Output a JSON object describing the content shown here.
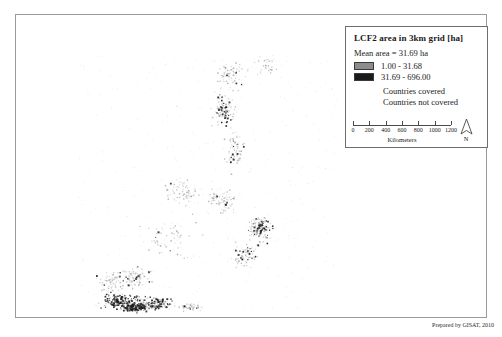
{
  "legend": {
    "title": "LCF2 area in 3km grid [ha]",
    "mean_area": "Mean area = 31.69 ha",
    "classes": [
      {
        "swatch_color": "#8c8c8c",
        "label": "1.00  -   31.68"
      },
      {
        "swatch_color": "#1a1a1a",
        "label": "31.69  -  696.00"
      }
    ],
    "countries_covered": "Countries covered",
    "countries_not_covered": "Countries not covered",
    "scalebar": {
      "ticks": [
        "0",
        "200",
        "400",
        "600",
        "800",
        "1000",
        "1200"
      ],
      "unit": "Kilometers"
    },
    "north_label": "N"
  },
  "credit": "Prepared by GISAT, 2010",
  "chart_data": {
    "type": "scatter",
    "title": "LCF2 area in 3km grid [ha]",
    "xlabel": "",
    "ylabel": "",
    "grid": false,
    "legend_position": "top-right",
    "classes": [
      {
        "name": "1.00  -   31.68",
        "color": "#8c8c8c"
      },
      {
        "name": "31.69  -  696.00",
        "color": "#1a1a1a"
      }
    ],
    "clusters": [
      {
        "name": "mainland-north",
        "cx": 215,
        "cy": 60,
        "rx": 22,
        "ry": 20,
        "n": 70,
        "dark_ratio": 0.1,
        "density": "sparse"
      },
      {
        "name": "mainland-central",
        "cx": 208,
        "cy": 95,
        "rx": 16,
        "ry": 22,
        "n": 120,
        "dark_ratio": 0.22,
        "density": "medium"
      },
      {
        "name": "mainland-peninsula",
        "cx": 218,
        "cy": 135,
        "rx": 14,
        "ry": 26,
        "n": 60,
        "dark_ratio": 0.08,
        "density": "sparse"
      },
      {
        "name": "north-outlier",
        "cx": 250,
        "cy": 50,
        "rx": 14,
        "ry": 14,
        "n": 30,
        "dark_ratio": 0.05,
        "density": "sparse"
      },
      {
        "name": "borneo-west",
        "cx": 165,
        "cy": 175,
        "rx": 26,
        "ry": 20,
        "n": 70,
        "dark_ratio": 0.06,
        "density": "sparse"
      },
      {
        "name": "borneo-east",
        "cx": 205,
        "cy": 185,
        "rx": 22,
        "ry": 22,
        "n": 80,
        "dark_ratio": 0.08,
        "density": "sparse"
      },
      {
        "name": "sulawesi",
        "cx": 243,
        "cy": 216,
        "rx": 16,
        "ry": 16,
        "n": 90,
        "dark_ratio": 0.28,
        "density": "medium"
      },
      {
        "name": "philippines-luzon",
        "cx": 243,
        "cy": 210,
        "rx": 12,
        "ry": 12,
        "n": 70,
        "dark_ratio": 0.25,
        "density": "medium"
      },
      {
        "name": "philippines-visayas",
        "cx": 228,
        "cy": 240,
        "rx": 18,
        "ry": 16,
        "n": 80,
        "dark_ratio": 0.14,
        "density": "medium"
      },
      {
        "name": "sumatra-south",
        "cx": 118,
        "cy": 262,
        "rx": 22,
        "ry": 14,
        "n": 90,
        "dark_ratio": 0.12,
        "density": "medium"
      },
      {
        "name": "java-west",
        "cx": 105,
        "cy": 285,
        "rx": 28,
        "ry": 10,
        "n": 200,
        "dark_ratio": 0.45,
        "density": "dense"
      },
      {
        "name": "java-east",
        "cx": 140,
        "cy": 288,
        "rx": 22,
        "ry": 8,
        "n": 150,
        "dark_ratio": 0.38,
        "density": "dense"
      },
      {
        "name": "java-core",
        "cx": 118,
        "cy": 292,
        "rx": 18,
        "ry": 6,
        "n": 160,
        "dark_ratio": 0.55,
        "density": "dense"
      },
      {
        "name": "sumatra-central",
        "cx": 95,
        "cy": 268,
        "rx": 20,
        "ry": 16,
        "n": 70,
        "dark_ratio": 0.1,
        "density": "sparse"
      },
      {
        "name": "bali-nusa",
        "cx": 175,
        "cy": 292,
        "rx": 16,
        "ry": 6,
        "n": 40,
        "dark_ratio": 0.12,
        "density": "sparse"
      },
      {
        "name": "scatter-midsea",
        "cx": 150,
        "cy": 225,
        "rx": 40,
        "ry": 30,
        "n": 60,
        "dark_ratio": 0.04,
        "density": "sparse"
      }
    ]
  }
}
